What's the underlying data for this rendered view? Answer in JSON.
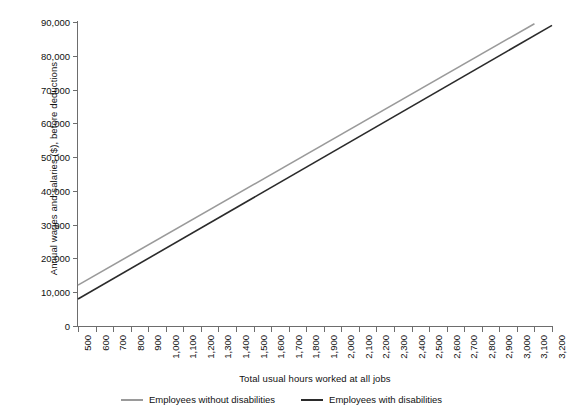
{
  "chart_data": {
    "type": "line",
    "title": "",
    "xlabel": "Total usual hours worked at all jobs",
    "ylabel": "Annual wages and salaries ($), before deductions",
    "xlim": [
      500,
      3200
    ],
    "ylim": [
      0,
      90000
    ],
    "grid": false,
    "legend_position": "bottom",
    "x_tick_labels": [
      "500",
      "600",
      "700",
      "800",
      "900",
      "1,000",
      "1,100",
      "1,200",
      "1,300",
      "1,400",
      "1,500",
      "1,600",
      "1,700",
      "1,800",
      "1,900",
      "2,000",
      "2,100",
      "2,200",
      "2,300",
      "2,400",
      "2,500",
      "2,600",
      "2,700",
      "2,800",
      "2,900",
      "3,000",
      "3,100",
      "3,200"
    ],
    "x_tick_values": [
      500,
      600,
      700,
      800,
      900,
      1000,
      1100,
      1200,
      1300,
      1400,
      1500,
      1600,
      1700,
      1800,
      1900,
      2000,
      2100,
      2200,
      2300,
      2400,
      2500,
      2600,
      2700,
      2800,
      2900,
      3000,
      3100,
      3200
    ],
    "y_tick_labels": [
      "0",
      "10,000",
      "20,000",
      "30,000",
      "40,000",
      "50,000",
      "60,000",
      "70,000",
      "80,000",
      "90,000"
    ],
    "y_tick_values": [
      0,
      10000,
      20000,
      30000,
      40000,
      50000,
      60000,
      70000,
      80000,
      90000
    ],
    "series": [
      {
        "name": "Employees without disabilities",
        "color": "#9a9a9a",
        "x": [
          500,
          3100
        ],
        "values": [
          12100,
          89500
        ]
      },
      {
        "name": "Employees with disabilities",
        "color": "#2b2b2b",
        "x": [
          500,
          3200
        ],
        "values": [
          8000,
          89000
        ]
      }
    ]
  },
  "legend": {
    "items": [
      {
        "label": "Employees without disabilities",
        "color": "#9a9a9a"
      },
      {
        "label": "Employees with disabilities",
        "color": "#2b2b2b"
      }
    ]
  },
  "axes": {
    "y_title": "Annual wages and salaries ($), before deductions",
    "x_title": "Total usual hours worked at all jobs"
  },
  "style": {
    "axis_color": "#6d6d6d",
    "text_color": "#111111",
    "background": "#ffffff"
  }
}
